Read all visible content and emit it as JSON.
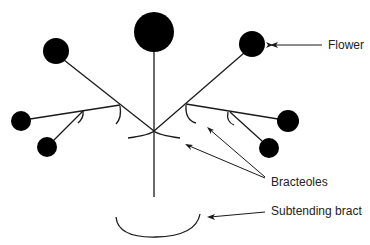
{
  "diagram": {
    "type": "botanical inflorescence (dichasial cyme)",
    "labels": {
      "flower": "Flower",
      "bracteoles": "Bracteoles",
      "subtending_bract": "Subtending bract"
    },
    "colors": {
      "ink": "#000000",
      "line": "#1a1a1a",
      "text": "#222222",
      "background": "#ffffff"
    },
    "flowers": [
      {
        "id": "terminal",
        "cx": 154,
        "cy": 32,
        "r": 20
      },
      {
        "id": "upper-left",
        "cx": 56,
        "cy": 51,
        "r": 13
      },
      {
        "id": "upper-right",
        "cx": 252,
        "cy": 44,
        "r": 13
      },
      {
        "id": "far-left",
        "cx": 21,
        "cy": 121,
        "r": 10
      },
      {
        "id": "lower-left",
        "cx": 47,
        "cy": 147,
        "r": 10
      },
      {
        "id": "far-right",
        "cx": 288,
        "cy": 121,
        "r": 11
      },
      {
        "id": "lower-right",
        "cx": 269,
        "cy": 148,
        "r": 10
      }
    ]
  }
}
